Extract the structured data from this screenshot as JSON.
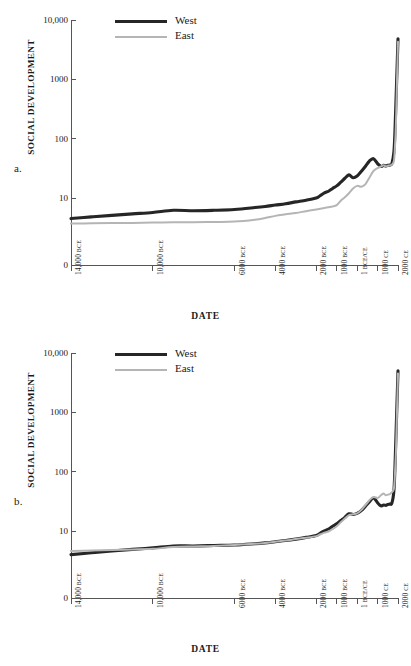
{
  "figure": {
    "panels": [
      {
        "id": "a",
        "label": "a.",
        "legend": [
          {
            "name": "West",
            "label": "West",
            "color": "#262626",
            "width": 3.1
          },
          {
            "name": "East",
            "label": "East",
            "color": "#b5b5b5",
            "width": 2.0
          }
        ]
      },
      {
        "id": "b",
        "label": "b.",
        "legend": [
          {
            "name": "West",
            "label": "West",
            "color": "#262626",
            "width": 3.1
          },
          {
            "name": "East",
            "label": "East",
            "color": "#b5b5b5",
            "width": 2.0
          }
        ]
      }
    ]
  },
  "axes": {
    "ylabel": "SOCIAL DEVELOPMENT",
    "xlabel": "DATE",
    "yticks": [
      {
        "value": 10000,
        "label": "10,000"
      },
      {
        "value": 1000,
        "label": "1000"
      },
      {
        "value": 100,
        "label": "100"
      },
      {
        "value": 10,
        "label": "10"
      },
      {
        "value": 0,
        "label": "0"
      }
    ],
    "xticks": [
      {
        "year": -14000,
        "num": "14,000",
        "era": "BCE"
      },
      {
        "year": -10000,
        "num": "10,000",
        "era": "BCE"
      },
      {
        "year": -6000,
        "num": "6000",
        "era": "BCE"
      },
      {
        "year": -4000,
        "num": "4000",
        "era": "BCE"
      },
      {
        "year": -2000,
        "num": "2000",
        "era": "BCE"
      },
      {
        "year": -1000,
        "num": "1000",
        "era": "BCE"
      },
      {
        "year": 0,
        "num": "1",
        "era": "BCE/CE"
      },
      {
        "year": 1000,
        "num": "1000",
        "era": "CE"
      },
      {
        "year": 2000,
        "num": "2000",
        "era": "CE"
      }
    ]
  },
  "chart_data": [
    {
      "type": "line",
      "panel": "a",
      "title": "",
      "xlabel": "DATE",
      "ylabel": "SOCIAL DEVELOPMENT",
      "yscale": "log",
      "ylim": [
        2.6,
        10000
      ],
      "xlim": [
        -14000,
        2000
      ],
      "grid": false,
      "legend_position": "top-left",
      "x": [
        -14000,
        -13000,
        -12000,
        -11000,
        -10000,
        -9000,
        -8000,
        -7000,
        -6000,
        -5000,
        -4500,
        -4000,
        -3500,
        -3000,
        -2500,
        -2000,
        -1800,
        -1600,
        -1400,
        -1200,
        -1000,
        -800,
        -600,
        -400,
        -200,
        0,
        200,
        400,
        600,
        800,
        1000,
        1100,
        1200,
        1300,
        1400,
        1500,
        1600,
        1700,
        1800,
        1850,
        1900,
        1950,
        2000
      ],
      "series": [
        {
          "name": "West",
          "label": "West",
          "color": "#262626",
          "linewidth": 3.1,
          "values": [
            4.5,
            4.8,
            5.1,
            5.4,
            5.7,
            6.2,
            6.1,
            6.2,
            6.4,
            6.9,
            7.2,
            7.6,
            8.0,
            8.6,
            9.2,
            10.0,
            11.0,
            12.2,
            13.0,
            14.5,
            16.0,
            18.5,
            21.5,
            24.5,
            22.0,
            23.5,
            28.0,
            34.0,
            42.0,
            46.0,
            38.0,
            35.5,
            34.0,
            35.5,
            34.5,
            35.5,
            36.0,
            38.0,
            60.0,
            130.0,
            420.0,
            1400.0,
            4800.0
          ]
        },
        {
          "name": "East",
          "label": "East",
          "color": "#b5b5b5",
          "linewidth": 2.0,
          "values": [
            3.7,
            3.75,
            3.8,
            3.8,
            3.85,
            3.9,
            3.9,
            3.95,
            4.0,
            4.3,
            4.6,
            5.0,
            5.3,
            5.6,
            6.0,
            6.4,
            6.6,
            6.8,
            7.0,
            7.2,
            7.6,
            9.0,
            10.3,
            12.0,
            14.5,
            16.0,
            15.5,
            17.0,
            22.0,
            28.5,
            32.0,
            33.0,
            34.5,
            35.5,
            34.0,
            35.0,
            35.5,
            36.5,
            42.0,
            70.0,
            180.0,
            900.0,
            4300.0
          ]
        }
      ]
    },
    {
      "type": "line",
      "panel": "b",
      "title": "",
      "xlabel": "DATE",
      "ylabel": "SOCIAL DEVELOPMENT",
      "yscale": "log",
      "ylim": [
        2.6,
        10000
      ],
      "xlim": [
        -14000,
        2000
      ],
      "grid": false,
      "legend_position": "top-left",
      "x": [
        -14000,
        -13000,
        -12000,
        -11000,
        -10000,
        -9000,
        -8000,
        -7000,
        -6000,
        -5000,
        -4500,
        -4000,
        -3500,
        -3000,
        -2500,
        -2000,
        -1800,
        -1600,
        -1400,
        -1200,
        -1000,
        -800,
        -600,
        -400,
        -200,
        0,
        200,
        400,
        600,
        800,
        1000,
        1100,
        1200,
        1300,
        1400,
        1500,
        1600,
        1700,
        1800,
        1850,
        1900,
        1950,
        2000
      ],
      "series": [
        {
          "name": "West",
          "label": "West",
          "color": "#262626",
          "linewidth": 3.1,
          "values": [
            4.0,
            4.3,
            4.6,
            4.9,
            5.2,
            5.6,
            5.6,
            5.7,
            5.8,
            6.1,
            6.3,
            6.6,
            6.9,
            7.3,
            7.8,
            8.4,
            9.2,
            10.0,
            10.8,
            12.0,
            13.2,
            15.0,
            17.0,
            19.5,
            19.0,
            19.8,
            22.0,
            26.0,
            31.0,
            36.0,
            30.0,
            27.5,
            26.5,
            27.5,
            27.0,
            28.0,
            28.5,
            29.5,
            48.0,
            115.0,
            400.0,
            1400.0,
            5000.0
          ]
        },
        {
          "name": "East",
          "label": "East",
          "color": "#b5b5b5",
          "linewidth": 2.0,
          "values": [
            4.6,
            4.7,
            4.8,
            4.9,
            5.0,
            5.4,
            5.5,
            5.6,
            5.8,
            6.1,
            6.3,
            6.6,
            6.9,
            7.3,
            7.7,
            8.2,
            8.8,
            9.4,
            9.8,
            10.8,
            12.0,
            14.0,
            16.2,
            18.5,
            19.2,
            19.8,
            22.5,
            27.0,
            33.0,
            37.5,
            36.0,
            38.0,
            41.0,
            43.0,
            40.0,
            41.0,
            42.0,
            45.0,
            52.0,
            90.0,
            220.0,
            1000.0,
            4500.0
          ]
        }
      ]
    }
  ]
}
